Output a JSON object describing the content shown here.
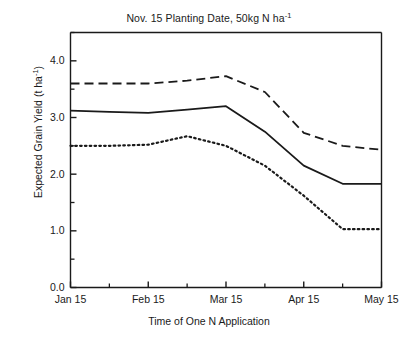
{
  "chart_data": {
    "type": "line",
    "title": "Nov. 15 Planting Date, 50kg N ha-1",
    "title_main": "Nov. 15 Planting Date, 50kg N ha",
    "title_sup": "-1",
    "xlabel": "Time of One N Application",
    "ylabel_main": "Expected Grain Yield (t ha",
    "ylabel_sup": "-1",
    "ylabel_tail": ")",
    "ylabel": "Expected Grain Yield (t ha-1)",
    "grid": false,
    "legend": "none",
    "ylim": [
      0.0,
      4.5
    ],
    "ytick_labels": [
      "0.0",
      "1.0",
      "2.0",
      "3.0",
      "4.0"
    ],
    "ytick_values": [
      0.0,
      1.0,
      2.0,
      3.0,
      4.0
    ],
    "yminor_values": [
      0.5,
      1.5,
      2.5,
      3.5,
      4.5
    ],
    "xtick_labels": [
      "Jan 15",
      "Feb 15",
      "Mar 15",
      "Apr 15",
      "May 15"
    ],
    "xtick_values": [
      0,
      1,
      2,
      3,
      4
    ],
    "xminor_values": [
      0.5,
      1.5,
      2.5,
      3.5
    ],
    "xlim": [
      0,
      4
    ],
    "categories": [
      "Jan 15",
      "Feb 1",
      "Feb 15",
      "Mar 1",
      "Mar 15",
      "Apr 1",
      "Apr 15",
      "May 1",
      "May 15"
    ],
    "x": [
      0.0,
      0.5,
      1.0,
      1.5,
      2.0,
      2.5,
      3.0,
      3.5,
      4.0
    ],
    "series": [
      {
        "name": "upper",
        "style": "dashed",
        "color": "#1a1a1a",
        "values": [
          3.6,
          3.6,
          3.6,
          3.65,
          3.73,
          3.45,
          2.73,
          2.5,
          2.43
        ]
      },
      {
        "name": "middle",
        "style": "solid",
        "color": "#1a1a1a",
        "values": [
          3.12,
          3.1,
          3.08,
          3.14,
          3.2,
          2.75,
          2.15,
          1.83,
          1.83
        ]
      },
      {
        "name": "lower",
        "style": "dotted",
        "color": "#1a1a1a",
        "values": [
          2.5,
          2.5,
          2.52,
          2.67,
          2.5,
          2.15,
          1.62,
          1.03,
          1.03
        ]
      }
    ]
  }
}
